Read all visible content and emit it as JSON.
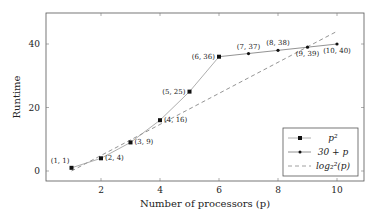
{
  "chart_data": {
    "type": "line",
    "title": "",
    "xlabel": "Number of processors (p)",
    "ylabel": "Runtime",
    "xlim": [
      0,
      11
    ],
    "ylim": [
      -3,
      48
    ],
    "xticks": [
      2,
      4,
      6,
      8,
      10
    ],
    "yticks": [
      0,
      20,
      40
    ],
    "grid": false,
    "legend_position": "lower right",
    "series": [
      {
        "name": "p^2",
        "legend_label": "p²",
        "style": "solid",
        "marker": "square",
        "x": [
          1,
          2,
          3,
          4,
          5,
          6
        ],
        "y": [
          1,
          4,
          9,
          16,
          25,
          36
        ],
        "labels": [
          "(1, 1)",
          "(2, 4)",
          "(3, 9)",
          "(4, 16)",
          "(5, 25)",
          "(6, 36)"
        ]
      },
      {
        "name": "30 + p",
        "legend_label": "30 + p",
        "style": "solid",
        "marker": "dot",
        "x": [
          6,
          7,
          8,
          9,
          10
        ],
        "y": [
          36,
          37,
          38,
          39,
          40
        ],
        "labels": [
          "(6, 36)",
          "(7, 37)",
          "(8, 38)",
          "(9, 39)",
          "(10, 40)"
        ]
      },
      {
        "name": "log_2^2(p)",
        "legend_label": "log₂²(p)",
        "style": "dashed",
        "marker": "none",
        "x": [
          1,
          10
        ],
        "y": [
          0,
          44
        ]
      }
    ]
  }
}
